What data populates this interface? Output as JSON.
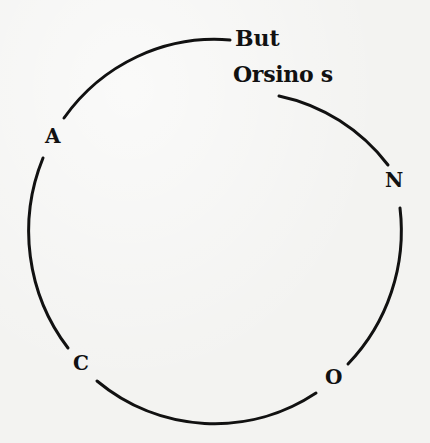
{
  "diagram": {
    "type": "circle-with-labeled-points",
    "stroke_color": "#111111",
    "background_color": "#f3f3f1",
    "labels": {
      "top_line1": "But",
      "top_line2": "Orsino s",
      "left_upper": "A",
      "right_upper": "N",
      "left_lower": "C",
      "right_lower": "O"
    },
    "sequence_clockwise": [
      "But Orsino s",
      "N",
      "O",
      "C",
      "A"
    ]
  }
}
